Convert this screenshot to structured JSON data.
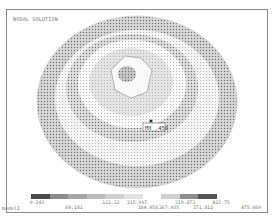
{
  "window": {
    "title": "NODAL SOLUTION",
    "footer_label": "model1"
  },
  "plot": {
    "type": "contour",
    "object": "sphere",
    "marker": {
      "label": "MX",
      "value": "0.458"
    }
  },
  "legend": {
    "values_top": [
      "0.243",
      "112.12",
      "215.997",
      "319.873",
      "423.75"
    ],
    "values_bottom": [
      "60.181",
      "164.058",
      "267.935",
      "371.812",
      "475.669"
    ],
    "colors": [
      "#4a4a4a",
      "#8c8c8c",
      "#a6a6a6",
      "#bcbcbc",
      "#cfcfcf",
      "#e2e2e2",
      "#ffffff",
      "#d0d0d0",
      "#8e8e8e",
      "#555555"
    ]
  }
}
